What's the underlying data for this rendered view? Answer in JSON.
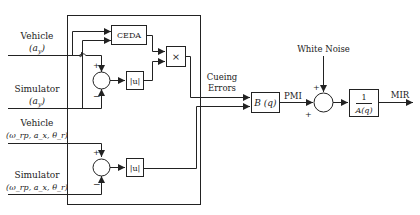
{
  "diagram": {
    "type": "block-diagram",
    "inputs": [
      {
        "name": "Vehicle",
        "signal": "(a_y)",
        "display": "(a",
        "sub": "y"
      },
      {
        "name": "Simulator",
        "signal": "(a_y)",
        "display": "(a",
        "sub": "y"
      },
      {
        "name": "Vehicle",
        "signal": "(ω_rp, a_x, θ_r)"
      },
      {
        "name": "Simulator",
        "signal": "(ω_rp, a_x, θ_r)"
      }
    ],
    "blocks": {
      "ceda": "CEDA",
      "multiply": "×",
      "abs1": "|u|",
      "abs2": "|u|",
      "b_filter": "B (q)",
      "a_filter_num": "1",
      "a_filter_den": "A(q)"
    },
    "sum_signs": {
      "sum1_top": "+",
      "sum1_bottom": "−",
      "sum2_top": "+",
      "sum2_bottom": "−",
      "sum3_top": "+",
      "sum3_left": "+"
    },
    "labels": {
      "cueing_errors_line1": "Cueing",
      "cueing_errors_line2": "Errors",
      "white_noise": "White Noise",
      "pmi": "PMI",
      "mir": "MIR"
    },
    "colors": {
      "line": "#222222",
      "background": "#ffffff"
    }
  }
}
